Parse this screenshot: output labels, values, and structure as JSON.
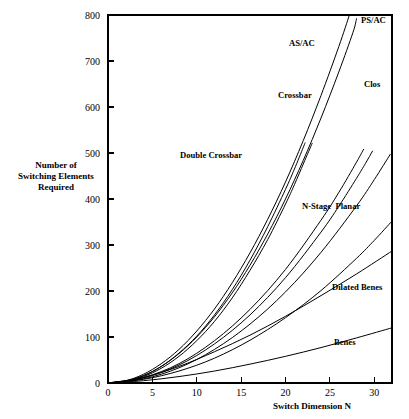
{
  "chart_data": {
    "type": "line",
    "title": "",
    "xlabel": "Switch Dimension N",
    "ylabel": "Number of\nSwitching Elements\nRequired",
    "ylabel_lines": [
      "Number of",
      "Switching Elements",
      "Required"
    ],
    "xlim": [
      0,
      32
    ],
    "ylim": [
      0,
      800
    ],
    "xticks": [
      0,
      5,
      10,
      15,
      20,
      25,
      30
    ],
    "xtick_labels": [
      "0",
      "5",
      "10",
      "15",
      "20",
      "25",
      "30"
    ],
    "yticks": [
      0,
      100,
      200,
      300,
      400,
      500,
      600,
      700,
      800
    ],
    "ytick_labels": [
      "0",
      "100",
      "200",
      "300",
      "400",
      "500",
      "600",
      "700",
      "800"
    ],
    "grid": false,
    "legend": "inline-labels",
    "line_color": "#000000",
    "background": "#ffffff",
    "series": [
      {
        "name": "AS/AC",
        "label": "AS/AC",
        "label_x": 289,
        "label_y": 46,
        "points": [
          [
            0,
            0
          ],
          [
            2,
            4
          ],
          [
            4,
            14
          ],
          [
            6,
            32
          ],
          [
            8,
            58
          ],
          [
            10,
            92
          ],
          [
            12,
            134
          ],
          [
            14,
            185
          ],
          [
            16,
            245
          ],
          [
            18,
            312
          ],
          [
            20,
            389
          ],
          [
            21,
            431
          ],
          [
            22,
            476
          ],
          [
            22.6,
            503
          ],
          [
            23,
            521
          ]
        ]
      },
      {
        "name": "AS/AC-2",
        "label": "",
        "label_x": 0,
        "label_y": 0,
        "points": [
          [
            0,
            0
          ],
          [
            2,
            4
          ],
          [
            4,
            16
          ],
          [
            6,
            36
          ],
          [
            8,
            65
          ],
          [
            10,
            102
          ],
          [
            12,
            148
          ],
          [
            14,
            203
          ],
          [
            16,
            267
          ],
          [
            18,
            340
          ],
          [
            20,
            421
          ],
          [
            21,
            465
          ],
          [
            22,
            512
          ],
          [
            22.2,
            522
          ]
        ]
      },
      {
        "name": "Crossbar",
        "label": "Crossbar",
        "label_x": 278,
        "label_y": 98,
        "points": [
          [
            0,
            0
          ],
          [
            2,
            4
          ],
          [
            4,
            16
          ],
          [
            6,
            36
          ],
          [
            8,
            64
          ],
          [
            10,
            100
          ],
          [
            12,
            144
          ],
          [
            14,
            196
          ],
          [
            16,
            256
          ],
          [
            18,
            324
          ],
          [
            20,
            400
          ],
          [
            22,
            484
          ],
          [
            24,
            576
          ],
          [
            26,
            676
          ],
          [
            27.6,
            762
          ],
          [
            28,
            792
          ]
        ]
      },
      {
        "name": "Double Crossbar",
        "label": "Double Crossbar",
        "label_x": 180,
        "label_y": 158,
        "points": [
          [
            0,
            0
          ],
          [
            2,
            5
          ],
          [
            4,
            19
          ],
          [
            6,
            42
          ],
          [
            8,
            73
          ],
          [
            10,
            113
          ],
          [
            12,
            161
          ],
          [
            14,
            218
          ],
          [
            16,
            283
          ],
          [
            18,
            356
          ],
          [
            20,
            437
          ],
          [
            22,
            527
          ],
          [
            24,
            625
          ],
          [
            26,
            731
          ],
          [
            27.2,
            800
          ]
        ]
      },
      {
        "name": "PS/AC",
        "label": "PS/AC",
        "label_x": 361,
        "label_y": 23,
        "points": [
          [
            0,
            0
          ],
          [
            4,
            11
          ],
          [
            8,
            39
          ],
          [
            12,
            85
          ],
          [
            16,
            148
          ],
          [
            20,
            229
          ],
          [
            24,
            328
          ],
          [
            26,
            384
          ],
          [
            28,
            445
          ],
          [
            29,
            477
          ],
          [
            29.8,
            504
          ]
        ]
      },
      {
        "name": "PS/AC-2",
        "label": "",
        "label_x": 0,
        "label_y": 0,
        "points": [
          [
            0,
            0
          ],
          [
            4,
            12
          ],
          [
            8,
            42
          ],
          [
            12,
            92
          ],
          [
            16,
            160
          ],
          [
            20,
            247
          ],
          [
            24,
            354
          ],
          [
            26,
            414
          ],
          [
            28,
            480
          ],
          [
            28.8,
            508
          ]
        ]
      },
      {
        "name": "Clos",
        "label": "Clos",
        "label_x": 364,
        "label_y": 87,
        "points": [
          [
            0,
            0
          ],
          [
            4,
            9
          ],
          [
            8,
            33
          ],
          [
            12,
            73
          ],
          [
            16,
            128
          ],
          [
            20,
            198
          ],
          [
            24,
            284
          ],
          [
            28,
            385
          ],
          [
            30,
            442
          ],
          [
            31.8,
            497
          ]
        ]
      },
      {
        "name": "N-Stage Planar",
        "label": "N-Stage  Planar",
        "label_x": 302,
        "label_y": 209,
        "points": [
          [
            0,
            0
          ],
          [
            4,
            8
          ],
          [
            8,
            26
          ],
          [
            12,
            54
          ],
          [
            16,
            93
          ],
          [
            20,
            142
          ],
          [
            24,
            201
          ],
          [
            28,
            271
          ],
          [
            30,
            310
          ],
          [
            32,
            352
          ]
        ]
      },
      {
        "name": "Dilated Benes",
        "label": "Dilated Benes",
        "label_x": 332,
        "label_y": 290,
        "points": [
          [
            0,
            0
          ],
          [
            4,
            12
          ],
          [
            8,
            36
          ],
          [
            12,
            68
          ],
          [
            16,
            104
          ],
          [
            20,
            145
          ],
          [
            24,
            190
          ],
          [
            28,
            237
          ],
          [
            32,
            287
          ]
        ]
      },
      {
        "name": "Benes",
        "label": "Benes",
        "label_x": 334,
        "label_y": 345,
        "points": [
          [
            0,
            0
          ],
          [
            4,
            5
          ],
          [
            8,
            14
          ],
          [
            12,
            26
          ],
          [
            16,
            41
          ],
          [
            20,
            58
          ],
          [
            24,
            77
          ],
          [
            28,
            98
          ],
          [
            32,
            120
          ]
        ]
      }
    ]
  },
  "plot_geometry": {
    "left": 108,
    "right": 392,
    "top": 15,
    "bottom": 383
  },
  "axis_titles": {
    "x": "Switch Dimension N",
    "y_line1": "Number of",
    "y_line2": "Switching Elements",
    "y_line3": "Required"
  }
}
